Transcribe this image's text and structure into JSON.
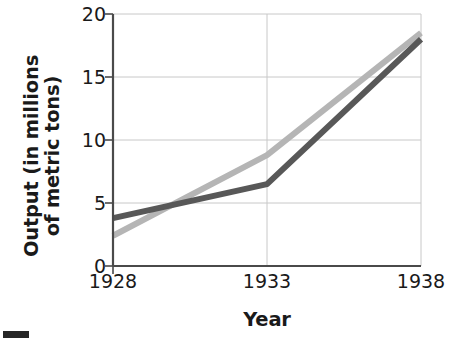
{
  "chart_data": {
    "type": "line",
    "title": "",
    "subtitle": "",
    "xlabel": "Year",
    "ylabel": "Output (in millions of metric tons)",
    "ylabel_line1": "Output (in millions",
    "ylabel_line2": "of metric tons)",
    "x": [
      1928,
      1933,
      1938
    ],
    "xlim": [
      1928,
      1938
    ],
    "ylim": [
      0,
      20
    ],
    "xticks": [
      1928,
      1933,
      1938
    ],
    "xtick_labels": [
      "1928",
      "1933",
      "1938"
    ],
    "yticks": [
      0,
      5,
      10,
      15,
      20
    ],
    "ytick_labels": [
      "0",
      "5",
      "10",
      "15",
      "20"
    ],
    "grid": true,
    "grid_axis": "both",
    "legend": false,
    "legend_position": "none",
    "series": [
      {
        "name": "light-gray-series",
        "color": "#b5b5b5",
        "values": [
          2.4,
          8.8,
          18.5
        ]
      },
      {
        "name": "dark-gray-series",
        "color": "#585858",
        "values": [
          3.8,
          6.5,
          18.0
        ]
      }
    ]
  },
  "axes": {
    "y_title_line1": "Output (in millions",
    "y_title_line2": "of metric tons)",
    "x_title": "Year",
    "y_labels": [
      "20",
      "15",
      "10",
      "5",
      "0"
    ],
    "x_labels": [
      "1928",
      "1933",
      "1938"
    ]
  },
  "colors": {
    "series_light": "#b5b5b5",
    "series_dark": "#585858",
    "grid": "#c8c8c8",
    "axis": "#4a4a4a",
    "text": "#1a1a1a",
    "background": "#ffffff",
    "corner_mark": "#262626"
  }
}
